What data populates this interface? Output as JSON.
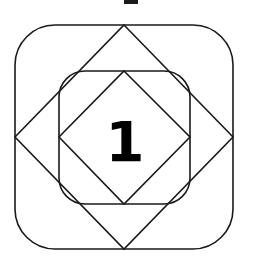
{
  "diagram": {
    "center_label": "1",
    "colors": {
      "stroke": "#1a1a1a",
      "background": "#ffffff",
      "text": "#000000"
    },
    "shapes": [
      {
        "name": "outer-rounded-square",
        "type": "rounded-rect"
      },
      {
        "name": "outer-diamond",
        "type": "diamond"
      },
      {
        "name": "inner-rounded-square",
        "type": "rounded-rect"
      },
      {
        "name": "inner-diamond",
        "type": "diamond"
      }
    ]
  }
}
